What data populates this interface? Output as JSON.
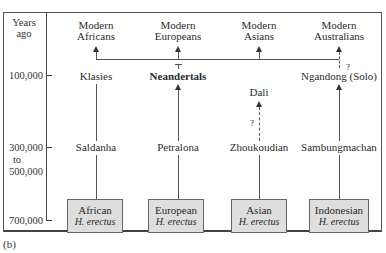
{
  "figure": {
    "caption": "(b)",
    "axis": {
      "title_line1": "Years",
      "title_line2": "ago",
      "ticks": [
        "100,000",
        "300,000",
        "to",
        "500,000",
        "700,000"
      ]
    },
    "columns": [
      {
        "modern_line1": "Modern",
        "modern_line2": "Africans",
        "mid": "Klasies",
        "lower": "Saldanha",
        "box_line1": "African",
        "box_line2": "H. erectus"
      },
      {
        "modern_line1": "Modern",
        "modern_line2": "Europeans",
        "mid": "Neandertals",
        "lower": "Petralona",
        "box_line1": "European",
        "box_line2": "H. erectus"
      },
      {
        "modern_line1": "Modern",
        "modern_line2": "Asians",
        "mid": "Dali",
        "lower": "Zhoukoudian",
        "box_line1": "Asian",
        "box_line2": "H. erectus"
      },
      {
        "modern_line1": "Modern",
        "modern_line2": "Australians",
        "mid": "Ngandong (Solo)",
        "lower": "Sambungmachan",
        "box_line1": "Indonesian",
        "box_line2": "H. erectus"
      }
    ],
    "uncertain_marker": "?"
  }
}
